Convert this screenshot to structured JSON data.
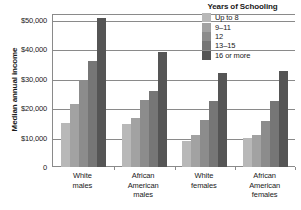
{
  "chart_data": {
    "type": "bar",
    "title": "",
    "xlabel": "",
    "ylabel": "Median annual income",
    "ylim": [
      0,
      52000
    ],
    "grid": true,
    "legend_position": "top-right",
    "legend_title": "Years of Schooling",
    "categories": [
      "White males",
      "African American males",
      "White females",
      "African American females"
    ],
    "category_lines": [
      [
        "White",
        "males"
      ],
      [
        "African",
        "American",
        "males"
      ],
      [
        "White",
        "females"
      ],
      [
        "African",
        "American",
        "females"
      ]
    ],
    "ytick_labels": [
      "$50,000",
      "$40,000",
      "$30,000",
      "$20,000",
      "$10,000",
      "0"
    ],
    "ytick_values": [
      50000,
      40000,
      30000,
      20000,
      10000,
      0
    ],
    "series": [
      {
        "name": "Up to 8",
        "color": "#b8b8b8",
        "values": [
          15000,
          14500,
          9000,
          10000
        ]
      },
      {
        "name": "9–11",
        "color": "#a2a2a2",
        "values": [
          21500,
          16500,
          10800,
          10900
        ]
      },
      {
        "name": "12",
        "color": "#8c8c8c",
        "values": [
          29500,
          22800,
          16000,
          15500
        ]
      },
      {
        "name": "13–15",
        "color": "#767676",
        "values": [
          36000,
          26000,
          22300,
          22600
        ]
      },
      {
        "name": "16 or more",
        "color": "#555555",
        "values": [
          50500,
          39000,
          32000,
          32700
        ]
      }
    ]
  },
  "axis_color": "#8a8a8a",
  "text_color": "#1a1a1a"
}
